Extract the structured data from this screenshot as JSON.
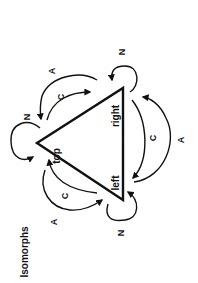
{
  "diagram": {
    "title": "Isomorphs",
    "orientation": "rotated -90deg",
    "nodes": [
      {
        "id": "top",
        "label": "top"
      },
      {
        "id": "right",
        "label": "right"
      },
      {
        "id": "left",
        "label": "left"
      }
    ],
    "edge_labels": {
      "self_loop": "N",
      "clockwise": "C",
      "anticlockwise": "A"
    },
    "edges": [
      {
        "from": "top",
        "to": "top",
        "label": "N"
      },
      {
        "from": "right",
        "to": "right",
        "label": "N"
      },
      {
        "from": "left",
        "to": "left",
        "label": "N"
      },
      {
        "from": "top",
        "to": "right",
        "label": "C"
      },
      {
        "from": "right",
        "to": "top",
        "label": "A"
      },
      {
        "from": "right",
        "to": "left",
        "label": "C"
      },
      {
        "from": "left",
        "to": "right",
        "label": "A"
      },
      {
        "from": "left",
        "to": "top",
        "label": "C"
      },
      {
        "from": "top",
        "to": "left",
        "label": "A"
      }
    ],
    "colors": {
      "ink": "#111111",
      "background": "#ffffff"
    }
  }
}
